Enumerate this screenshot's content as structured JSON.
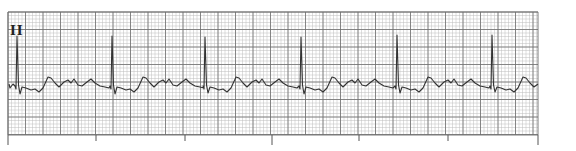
{
  "chart_data": {
    "type": "line",
    "title": "",
    "lead_label": "II",
    "grid": {
      "on": true,
      "x_start_px": 8,
      "x_end_px": 538,
      "y_start_px": 12,
      "y_end_px": 135,
      "minor_spacing_px": 3.5,
      "major_spacing_px": 17.5,
      "minor_color": "#bdbdbd",
      "major_color": "#6e6e6e"
    },
    "time_markers_px": [
      {
        "x": 8,
        "long": true
      },
      {
        "x": 96,
        "long": false
      },
      {
        "x": 185,
        "long": false
      },
      {
        "x": 272,
        "long": true
      },
      {
        "x": 359,
        "long": false
      },
      {
        "x": 448,
        "long": false
      },
      {
        "x": 538,
        "long": true
      }
    ],
    "baseline_y_px": 85,
    "r_peaks": [
      {
        "x": 17,
        "r_y": 36,
        "s_y": 94
      },
      {
        "x": 112,
        "r_y": 36,
        "s_y": 94
      },
      {
        "x": 205,
        "r_y": 37,
        "s_y": 93
      },
      {
        "x": 301,
        "r_y": 37,
        "s_y": 94
      },
      {
        "x": 397,
        "r_y": 35,
        "s_y": 93
      },
      {
        "x": 492,
        "r_y": 35,
        "s_y": 92
      }
    ],
    "rr_interval_px": 95,
    "trace_color": "#333333",
    "xlabel": "",
    "ylabel": ""
  }
}
